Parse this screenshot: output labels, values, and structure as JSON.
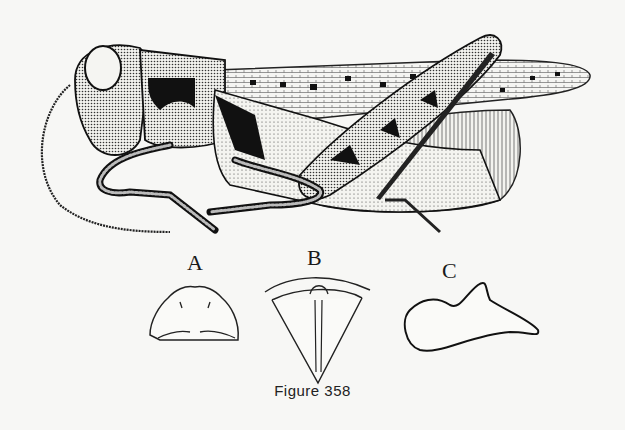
{
  "figure": {
    "caption": "Figure 358",
    "main_subject": "grasshopper-lateral-view",
    "subfigures": [
      {
        "label": "A",
        "subject": "pronotum-outline"
      },
      {
        "label": "B",
        "subject": "pronotum-dorsal-view"
      },
      {
        "label": "C",
        "subject": "appendage-outline"
      }
    ]
  }
}
